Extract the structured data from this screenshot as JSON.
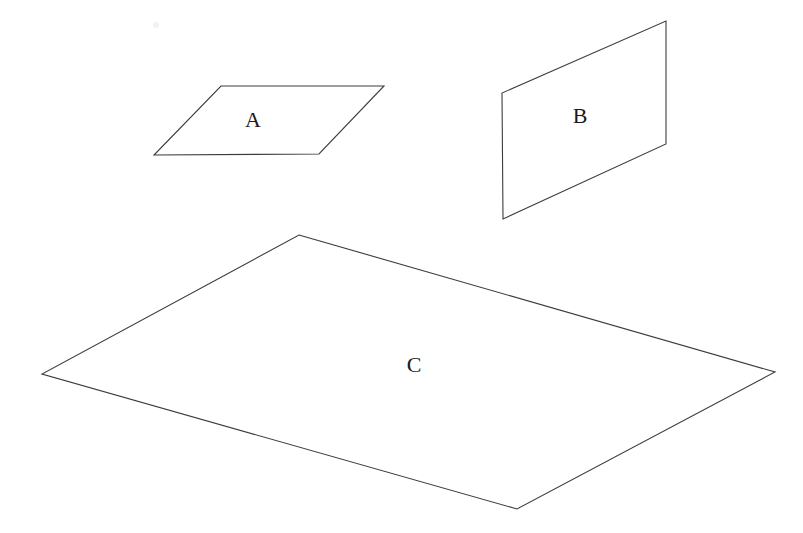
{
  "figure": {
    "background_color": "#ffffff",
    "stroke_color": "#3c3c3c",
    "label_color": "#1a1a1a",
    "stroke_width": 1.1,
    "width": 803,
    "height": 533
  },
  "shapes": [
    {
      "id": "plane-a",
      "label": "A",
      "type": "quadrilateral",
      "points": "221,86 384,86 319,154 154,155",
      "label_x": 253,
      "label_y": 122,
      "vertices": [
        {
          "name": "top-left",
          "x": 221,
          "y": 86
        },
        {
          "name": "top-right",
          "x": 384,
          "y": 86
        },
        {
          "name": "bottom-right",
          "x": 319,
          "y": 154
        },
        {
          "name": "bottom-left",
          "x": 154,
          "y": 155
        }
      ]
    },
    {
      "id": "plane-b",
      "label": "B",
      "type": "quadrilateral",
      "points": "666,21 666,144 503,219 502,93",
      "label_x": 580,
      "label_y": 118,
      "vertices": [
        {
          "name": "top-right",
          "x": 666,
          "y": 21
        },
        {
          "name": "bottom-right",
          "x": 666,
          "y": 144
        },
        {
          "name": "bottom-left",
          "x": 503,
          "y": 219
        },
        {
          "name": "top-left",
          "x": 502,
          "y": 93
        }
      ]
    },
    {
      "id": "plane-c",
      "label": "C",
      "type": "quadrilateral",
      "points": "299,235 775,372 517,509 42,374",
      "label_x": 414,
      "label_y": 367,
      "vertices": [
        {
          "name": "top",
          "x": 299,
          "y": 235
        },
        {
          "name": "right",
          "x": 775,
          "y": 372
        },
        {
          "name": "bottom",
          "x": 517,
          "y": 509
        },
        {
          "name": "left",
          "x": 42,
          "y": 374
        }
      ]
    }
  ],
  "artifacts": [
    {
      "id": "speck",
      "x": 156,
      "y": 25,
      "r": 3,
      "color": "#f2f2f2"
    }
  ]
}
